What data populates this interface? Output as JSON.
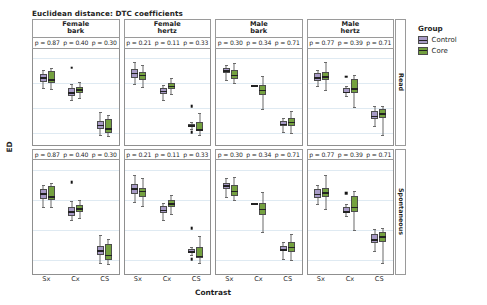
{
  "chart_data": {
    "type": "box",
    "title": "Euclidean distance: DTC coefficients",
    "xlabel": "Contrast",
    "ylabel": "ED",
    "ylim": [
      0.55,
      4.35
    ],
    "yticks": [
      1,
      2,
      3,
      4
    ],
    "categories": [
      "Sx",
      "Cx",
      "CS"
    ],
    "grid": true,
    "legend": {
      "title": "Group",
      "position": "right",
      "entries": [
        {
          "name": "Control",
          "color": "#a79ac6"
        },
        {
          "name": "Core",
          "color": "#74a13f"
        }
      ]
    },
    "col_facets": [
      {
        "line1": "Female",
        "line2": "bark"
      },
      {
        "line1": "Female",
        "line2": "hertz"
      },
      {
        "line1": "Male",
        "line2": "bark"
      },
      {
        "line1": "Male",
        "line2": "hertz"
      }
    ],
    "row_facets": [
      "Read",
      "Spontaneous"
    ],
    "panels": [
      {
        "row": "Read",
        "col": "Female bark",
        "pvalues": [
          "p = 0.87",
          "p = 0.40",
          "p = 0.30"
        ],
        "groups": [
          {
            "contrast": "Sx",
            "series": "Control",
            "min": 2.78,
            "q1": 3.04,
            "median": 3.23,
            "q3": 3.36,
            "max": 3.52,
            "outliers": []
          },
          {
            "contrast": "Sx",
            "series": "Core",
            "min": 2.76,
            "q1": 3.01,
            "median": 3.14,
            "q3": 3.46,
            "max": 3.58,
            "outliers": []
          },
          {
            "contrast": "Cx",
            "series": "Control",
            "min": 2.33,
            "q1": 2.48,
            "median": 2.63,
            "q3": 2.79,
            "max": 2.96,
            "outliers": [
              3.6
            ]
          },
          {
            "contrast": "Cx",
            "series": "Core",
            "min": 2.41,
            "q1": 2.61,
            "median": 2.74,
            "q3": 2.83,
            "max": 3.02,
            "outliers": []
          },
          {
            "contrast": "CS",
            "series": "Control",
            "min": 0.92,
            "q1": 1.18,
            "median": 1.33,
            "q3": 1.49,
            "max": 1.84,
            "outliers": []
          },
          {
            "contrast": "CS",
            "series": "Core",
            "min": 0.88,
            "q1": 1.02,
            "median": 1.19,
            "q3": 1.56,
            "max": 1.72,
            "outliers": []
          }
        ]
      },
      {
        "row": "Read",
        "col": "Female hertz",
        "pvalues": [
          "p = 0.21",
          "p = 0.11",
          "p = 0.33"
        ],
        "groups": [
          {
            "contrast": "Sx",
            "series": "Control",
            "min": 2.94,
            "q1": 3.19,
            "median": 3.4,
            "q3": 3.55,
            "max": 3.82,
            "outliers": []
          },
          {
            "contrast": "Sx",
            "series": "Core",
            "min": 2.82,
            "q1": 3.09,
            "median": 3.32,
            "q3": 3.42,
            "max": 3.72,
            "outliers": []
          },
          {
            "contrast": "Cx",
            "series": "Control",
            "min": 2.33,
            "q1": 2.57,
            "median": 2.69,
            "q3": 2.8,
            "max": 2.92,
            "outliers": []
          },
          {
            "contrast": "Cx",
            "series": "Core",
            "min": 2.54,
            "q1": 2.76,
            "median": 2.89,
            "q3": 2.99,
            "max": 3.18,
            "outliers": []
          },
          {
            "contrast": "CS",
            "series": "Control",
            "min": 1.18,
            "q1": 1.26,
            "median": 1.31,
            "q3": 1.38,
            "max": 1.46,
            "outliers": [
              2.07,
              1.04
            ]
          },
          {
            "contrast": "CS",
            "series": "Core",
            "min": 0.92,
            "q1": 1.07,
            "median": 1.16,
            "q3": 1.45,
            "max": 1.8,
            "outliers": []
          }
        ]
      },
      {
        "row": "Read",
        "col": "Male bark",
        "pvalues": [
          "p = 0.30",
          "p = 0.34",
          "p = 0.71"
        ],
        "groups": [
          {
            "contrast": "Sx",
            "series": "Control",
            "min": 3.12,
            "q1": 3.38,
            "median": 3.49,
            "q3": 3.58,
            "max": 3.72,
            "outliers": []
          },
          {
            "contrast": "Sx",
            "series": "Core",
            "min": 3.0,
            "q1": 3.14,
            "median": 3.32,
            "q3": 3.52,
            "max": 3.78,
            "outliers": []
          },
          {
            "contrast": "Cx",
            "series": "Control",
            "min": 2.88,
            "q1": 2.88,
            "median": 2.9,
            "q3": 2.91,
            "max": 2.92,
            "outliers": []
          },
          {
            "contrast": "Cx",
            "series": "Core",
            "min": 1.96,
            "q1": 2.52,
            "median": 2.72,
            "q3": 2.92,
            "max": 3.28,
            "outliers": []
          },
          {
            "contrast": "CS",
            "series": "Control",
            "min": 1.05,
            "q1": 1.3,
            "median": 1.38,
            "q3": 1.48,
            "max": 1.62,
            "outliers": []
          },
          {
            "contrast": "CS",
            "series": "Core",
            "min": 1.0,
            "q1": 1.28,
            "median": 1.46,
            "q3": 1.62,
            "max": 1.88,
            "outliers": []
          }
        ]
      },
      {
        "row": "Read",
        "col": "Male hertz",
        "pvalues": [
          "p = 0.77",
          "p = 0.39",
          "p = 0.71"
        ],
        "groups": [
          {
            "contrast": "Sx",
            "series": "Control",
            "min": 2.88,
            "q1": 3.08,
            "median": 3.22,
            "q3": 3.38,
            "max": 3.5,
            "outliers": []
          },
          {
            "contrast": "Sx",
            "series": "Core",
            "min": 2.72,
            "q1": 3.1,
            "median": 3.26,
            "q3": 3.42,
            "max": 3.84,
            "outliers": []
          },
          {
            "contrast": "Cx",
            "series": "Control",
            "min": 2.48,
            "q1": 2.58,
            "median": 2.64,
            "q3": 2.79,
            "max": 2.86,
            "outliers": [
              3.24
            ]
          },
          {
            "contrast": "Cx",
            "series": "Core",
            "min": 2.02,
            "q1": 2.6,
            "median": 2.78,
            "q3": 3.14,
            "max": 3.3,
            "outliers": []
          },
          {
            "contrast": "CS",
            "series": "Control",
            "min": 1.3,
            "q1": 1.58,
            "median": 1.7,
            "q3": 1.88,
            "max": 2.06,
            "outliers": []
          },
          {
            "contrast": "CS",
            "series": "Core",
            "min": 0.92,
            "q1": 1.62,
            "median": 1.8,
            "q3": 1.94,
            "max": 2.08,
            "outliers": []
          }
        ]
      },
      {
        "row": "Spontaneous",
        "col": "Female bark",
        "pvalues": [
          "p = 0.87",
          "p = 0.40",
          "p = 0.30"
        ],
        "groups": [
          {
            "contrast": "Sx",
            "series": "Control",
            "min": 2.78,
            "q1": 3.04,
            "median": 3.23,
            "q3": 3.36,
            "max": 3.52,
            "outliers": []
          },
          {
            "contrast": "Sx",
            "series": "Core",
            "min": 2.76,
            "q1": 3.01,
            "median": 3.14,
            "q3": 3.46,
            "max": 3.58,
            "outliers": []
          },
          {
            "contrast": "Cx",
            "series": "Control",
            "min": 2.33,
            "q1": 2.48,
            "median": 2.63,
            "q3": 2.79,
            "max": 2.96,
            "outliers": [
              3.6
            ]
          },
          {
            "contrast": "Cx",
            "series": "Core",
            "min": 2.41,
            "q1": 2.61,
            "median": 2.74,
            "q3": 2.83,
            "max": 3.02,
            "outliers": []
          },
          {
            "contrast": "CS",
            "series": "Control",
            "min": 0.92,
            "q1": 1.18,
            "median": 1.33,
            "q3": 1.49,
            "max": 1.84,
            "outliers": []
          },
          {
            "contrast": "CS",
            "series": "Core",
            "min": 0.88,
            "q1": 1.02,
            "median": 1.19,
            "q3": 1.56,
            "max": 1.72,
            "outliers": []
          }
        ]
      },
      {
        "row": "Spontaneous",
        "col": "Female hertz",
        "pvalues": [
          "p = 0.21",
          "p = 0.11",
          "p = 0.33"
        ],
        "groups": [
          {
            "contrast": "Sx",
            "series": "Control",
            "min": 2.94,
            "q1": 3.19,
            "median": 3.4,
            "q3": 3.55,
            "max": 3.82,
            "outliers": []
          },
          {
            "contrast": "Sx",
            "series": "Core",
            "min": 2.82,
            "q1": 3.09,
            "median": 3.32,
            "q3": 3.42,
            "max": 3.72,
            "outliers": []
          },
          {
            "contrast": "Cx",
            "series": "Control",
            "min": 2.33,
            "q1": 2.57,
            "median": 2.69,
            "q3": 2.8,
            "max": 2.92,
            "outliers": []
          },
          {
            "contrast": "Cx",
            "series": "Core",
            "min": 2.54,
            "q1": 2.76,
            "median": 2.89,
            "q3": 2.99,
            "max": 3.18,
            "outliers": []
          },
          {
            "contrast": "CS",
            "series": "Control",
            "min": 1.18,
            "q1": 1.26,
            "median": 1.31,
            "q3": 1.38,
            "max": 1.46,
            "outliers": [
              2.07,
              1.04
            ]
          },
          {
            "contrast": "CS",
            "series": "Core",
            "min": 0.92,
            "q1": 1.07,
            "median": 1.16,
            "q3": 1.45,
            "max": 1.8,
            "outliers": []
          }
        ]
      },
      {
        "row": "Spontaneous",
        "col": "Male bark",
        "pvalues": [
          "p = 0.30",
          "p = 0.34",
          "p = 0.71"
        ],
        "groups": [
          {
            "contrast": "Sx",
            "series": "Control",
            "min": 3.12,
            "q1": 3.38,
            "median": 3.49,
            "q3": 3.58,
            "max": 3.72,
            "outliers": []
          },
          {
            "contrast": "Sx",
            "series": "Core",
            "min": 3.0,
            "q1": 3.14,
            "median": 3.32,
            "q3": 3.52,
            "max": 3.78,
            "outliers": []
          },
          {
            "contrast": "Cx",
            "series": "Control",
            "min": 2.88,
            "q1": 2.88,
            "median": 2.9,
            "q3": 2.91,
            "max": 2.92,
            "outliers": []
          },
          {
            "contrast": "Cx",
            "series": "Core",
            "min": 1.96,
            "q1": 2.52,
            "median": 2.72,
            "q3": 2.92,
            "max": 3.28,
            "outliers": []
          },
          {
            "contrast": "CS",
            "series": "Control",
            "min": 1.05,
            "q1": 1.3,
            "median": 1.38,
            "q3": 1.48,
            "max": 1.62,
            "outliers": []
          },
          {
            "contrast": "CS",
            "series": "Core",
            "min": 1.0,
            "q1": 1.28,
            "median": 1.46,
            "q3": 1.62,
            "max": 1.88,
            "outliers": []
          }
        ]
      },
      {
        "row": "Spontaneous",
        "col": "Male hertz",
        "pvalues": [
          "p = 0.77",
          "p = 0.39",
          "p = 0.71"
        ],
        "groups": [
          {
            "contrast": "Sx",
            "series": "Control",
            "min": 2.88,
            "q1": 3.08,
            "median": 3.22,
            "q3": 3.38,
            "max": 3.5,
            "outliers": []
          },
          {
            "contrast": "Sx",
            "series": "Core",
            "min": 2.72,
            "q1": 3.1,
            "median": 3.26,
            "q3": 3.42,
            "max": 3.84,
            "outliers": []
          },
          {
            "contrast": "Cx",
            "series": "Control",
            "min": 2.48,
            "q1": 2.58,
            "median": 2.64,
            "q3": 2.79,
            "max": 2.86,
            "outliers": [
              3.24
            ]
          },
          {
            "contrast": "Cx",
            "series": "Core",
            "min": 2.02,
            "q1": 2.6,
            "median": 2.78,
            "q3": 3.14,
            "max": 3.3,
            "outliers": []
          },
          {
            "contrast": "CS",
            "series": "Control",
            "min": 1.3,
            "q1": 1.58,
            "median": 1.7,
            "q3": 1.88,
            "max": 2.06,
            "outliers": []
          },
          {
            "contrast": "CS",
            "series": "Core",
            "min": 0.92,
            "q1": 1.62,
            "median": 1.8,
            "q3": 1.94,
            "max": 2.08,
            "outliers": []
          }
        ]
      }
    ]
  }
}
